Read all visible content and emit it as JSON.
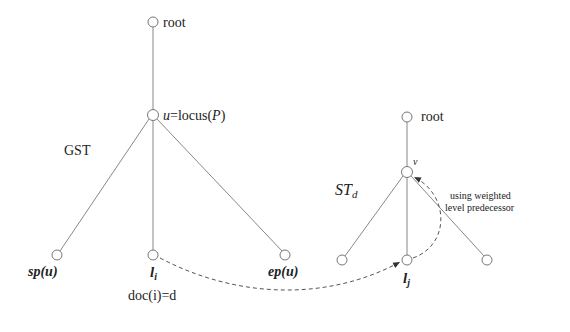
{
  "diagram": {
    "left_tree": {
      "name": "GST",
      "root_label": "root",
      "locus_label_prefix": "u",
      "locus_label_eq": "=locus(",
      "locus_label_var": "P",
      "locus_label_close": ")",
      "leaves": [
        {
          "id": "sp",
          "label": "sp(u)"
        },
        {
          "id": "li",
          "label_main": "l",
          "label_sub": "i"
        },
        {
          "id": "ep",
          "label": "ep(u)"
        }
      ],
      "doc_label": "doc(i)=d"
    },
    "right_tree": {
      "name_main": "ST",
      "name_sub": "d",
      "root_label": "root",
      "node_v_label": "v",
      "leaf_label_main": "l",
      "leaf_label_sub": "j"
    },
    "annotation": {
      "line1": "using weighted",
      "line2": "level predecessor"
    },
    "colors": {
      "edge": "#888888",
      "text": "#222222",
      "dashed": "#555555"
    }
  }
}
